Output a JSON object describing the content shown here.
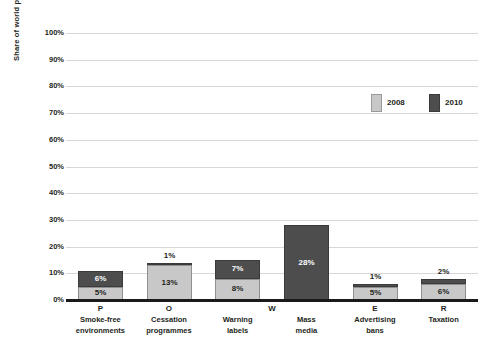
{
  "chart_data": {
    "type": "bar",
    "subtype": "stacked-bar",
    "title": "",
    "xlabel": "",
    "ylabel": "Share of world populat on",
    "ylim": [
      0,
      100
    ],
    "yticks": [
      "0%",
      "10%",
      "20%",
      "30%",
      "40%",
      "50%",
      "60%",
      "70%",
      "80%",
      "90%",
      "100%"
    ],
    "ytick_values": [
      0,
      10,
      20,
      30,
      40,
      50,
      60,
      70,
      80,
      90,
      100
    ],
    "grid": true,
    "legend_position": "top-right",
    "categories": [
      "Smoke-free environments",
      "Cessation programmes",
      "Warning labels",
      "Mass media",
      "Advertising bans",
      "Taxation"
    ],
    "category_lines": [
      [
        "Smoke-free",
        "environments"
      ],
      [
        "Cessation",
        "programmes"
      ],
      [
        "Warning",
        "labels"
      ],
      [
        "Mass",
        "media"
      ],
      [
        "Advertising",
        "bans"
      ],
      [
        "Taxation"
      ]
    ],
    "category_letters": [
      "P",
      "O",
      "W",
      "E",
      "R"
    ],
    "series": [
      {
        "name": "2008",
        "color": "#c8c8c8",
        "values": [
          5,
          13,
          8,
          0,
          5,
          6
        ],
        "labels": [
          "5%",
          "13%",
          "8%",
          "",
          "5%",
          "6%"
        ]
      },
      {
        "name": "2010",
        "color": "#4d4d4d",
        "values": [
          6,
          1,
          7,
          28,
          1,
          2
        ],
        "labels": [
          "6%",
          "1%",
          "7%",
          "28%",
          "1%",
          "2%"
        ]
      }
    ]
  },
  "legend": {
    "entries": [
      {
        "label": "2008",
        "color": "#c8c8c8"
      },
      {
        "label": "2010",
        "color": "#4d4d4d"
      }
    ]
  },
  "axis": {
    "y_title": "Share of world populat on"
  }
}
